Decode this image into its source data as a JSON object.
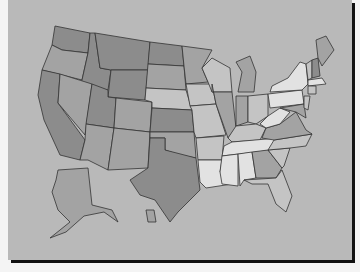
{
  "map": {
    "title": "United States map",
    "background": "#b9b9b9",
    "shades": {
      "dark": "#8c8c8c",
      "mid": "#a3a3a3",
      "light": "#c4c4c4",
      "pale": "#e2e2e2"
    },
    "states": [
      {
        "id": "WA",
        "shade": "dark",
        "points": "55,26 90,33 88,53 62,50 52,45"
      },
      {
        "id": "OR",
        "shade": "mid",
        "points": "42,70 52,45 62,50 88,53 82,80"
      },
      {
        "id": "CA",
        "shade": "dark",
        "points": "42,70 60,74 58,103 85,140 80,160 60,155 44,120 38,95"
      },
      {
        "id": "ID",
        "shade": "dark",
        "points": "90,33 95,33 100,68 111,70 108,90 80,85 82,80 88,53"
      },
      {
        "id": "NV",
        "shade": "mid",
        "points": "60,74 92,84 85,135 58,103"
      },
      {
        "id": "MT",
        "shade": "dark",
        "points": "95,33 150,42 148,70 111,70 100,68"
      },
      {
        "id": "WY",
        "shade": "dark",
        "points": "111,70 148,70 145,100 108,97"
      },
      {
        "id": "UT",
        "shade": "dark",
        "points": "92,84 108,90 108,97 116,98 114,128 86,124"
      },
      {
        "id": "AZ",
        "shade": "mid",
        "points": "86,124 114,128 108,170 88,160 80,160 85,140"
      },
      {
        "id": "CO",
        "shade": "mid",
        "points": "116,98 152,102 150,132 114,128"
      },
      {
        "id": "NM",
        "shade": "mid",
        "points": "114,128 150,132 148,168 108,170"
      },
      {
        "id": "ND",
        "shade": "dark",
        "points": "150,42 182,46 184,66 148,64"
      },
      {
        "id": "SD",
        "shade": "mid",
        "points": "148,64 184,66 186,90 146,88"
      },
      {
        "id": "NE",
        "shade": "light",
        "points": "146,88 186,90 192,110 152,108 152,102 145,100"
      },
      {
        "id": "KS",
        "shade": "dark",
        "points": "152,108 192,110 194,132 150,132"
      },
      {
        "id": "OK",
        "shade": "mid",
        "points": "150,132 194,132 196,158 180,155 165,150 165,138 150,138"
      },
      {
        "id": "TX",
        "shade": "dark",
        "points": "150,138 165,138 165,150 196,158 200,190 178,212 170,222 155,200 140,195 130,180 148,168"
      },
      {
        "id": "MN",
        "shade": "mid",
        "points": "182,46 212,50 202,68 208,82 186,84 184,66"
      },
      {
        "id": "IA",
        "shade": "light",
        "points": "186,84 212,84 216,104 190,106"
      },
      {
        "id": "MO",
        "shade": "light",
        "points": "190,106 216,104 226,135 196,138 194,132 192,110"
      },
      {
        "id": "AR",
        "shade": "light",
        "points": "196,138 224,136 222,160 198,160"
      },
      {
        "id": "LA",
        "shade": "pale",
        "points": "198,160 222,160 220,172 232,184 206,188 200,182"
      },
      {
        "id": "WI",
        "shade": "light",
        "points": "202,68 212,58 230,68 232,92 212,92 208,82"
      },
      {
        "id": "IL",
        "shade": "mid",
        "points": "212,92 232,92 236,128 228,138 216,104 212,84"
      },
      {
        "id": "MI",
        "shade": "mid",
        "points": "236,62 250,56 256,72 254,92 238,92 242,72"
      },
      {
        "id": "IN",
        "shade": "mid",
        "points": "236,96 248,96 248,122 236,126"
      },
      {
        "id": "OH",
        "shade": "light",
        "points": "248,96 268,94 268,116 256,124 248,122"
      },
      {
        "id": "KY",
        "shade": "light",
        "points": "228,138 236,126 256,124 266,128 260,140 232,142"
      },
      {
        "id": "TN",
        "shade": "pale",
        "points": "224,146 232,142 278,138 274,150 222,156"
      },
      {
        "id": "MS",
        "shade": "pale",
        "points": "222,156 238,154 238,186 222,184 220,172"
      },
      {
        "id": "AL",
        "shade": "pale",
        "points": "238,154 252,152 256,178 244,180 240,186"
      },
      {
        "id": "GA",
        "shade": "mid",
        "points": "252,152 268,150 282,168 276,178 256,178"
      },
      {
        "id": "FL",
        "shade": "light",
        "points": "244,180 276,178 282,170 292,196 286,212 276,204 268,184 252,184"
      },
      {
        "id": "SC",
        "shade": "light",
        "points": "268,150 290,148 284,166 282,168"
      },
      {
        "id": "NC",
        "shade": "light",
        "points": "274,140 312,134 306,146 290,148 268,150"
      },
      {
        "id": "VA",
        "shade": "mid",
        "points": "266,128 280,124 296,112 306,130 312,134 274,140 262,138"
      },
      {
        "id": "WV",
        "shade": "pale",
        "points": "268,116 280,108 290,112 280,124 266,128 260,124"
      },
      {
        "id": "PA",
        "shade": "pale",
        "points": "268,94 302,90 304,104 270,108"
      },
      {
        "id": "NY",
        "shade": "pale",
        "points": "272,86 288,78 300,62 306,64 308,84 302,90 270,92"
      },
      {
        "id": "MD",
        "shade": "mid",
        "points": "280,108 304,104 306,118 296,112"
      },
      {
        "id": "NJ",
        "shade": "light",
        "points": "304,96 310,96 308,110 304,108"
      },
      {
        "id": "VT",
        "shade": "light",
        "points": "306,64 312,60 312,78 308,80"
      },
      {
        "id": "NH",
        "shade": "dark",
        "points": "312,60 318,58 320,76 312,78"
      },
      {
        "id": "ME",
        "shade": "mid",
        "points": "316,40 326,36 334,50 322,66 318,58"
      },
      {
        "id": "MA",
        "shade": "pale",
        "points": "308,80 322,78 326,84 308,86"
      },
      {
        "id": "CT",
        "shade": "light",
        "points": "308,86 316,86 316,94 308,94"
      },
      {
        "id": "AK",
        "shade": "mid",
        "points": "58,170 88,168 92,205 112,210 118,222 104,212 84,216 66,232 50,238 70,222 58,210 52,192 56,180"
      },
      {
        "id": "HI",
        "shade": "mid",
        "points": "146,210 154,210 156,222 148,222"
      }
    ]
  }
}
